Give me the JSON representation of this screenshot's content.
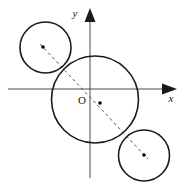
{
  "figure": {
    "width": 181,
    "height": 184,
    "background": "#ffffff",
    "stroke_color": "#1a1a1a",
    "dash_color": "#555555",
    "dot_color": "#000000"
  },
  "axes": {
    "origin": {
      "x": 90,
      "y": 89
    },
    "origin_label": "O",
    "x_axis": {
      "label": "x",
      "label_x": 171,
      "label_y": 102,
      "start_x": 8,
      "end_x": 176,
      "y": 89,
      "arrow": "right"
    },
    "y_axis": {
      "label": "y",
      "label_x": 75,
      "label_y": 17,
      "x": 90,
      "start_y": 178,
      "end_y": 9,
      "arrow": "up"
    }
  },
  "circles": [
    {
      "name": "upper-left-circle",
      "cx": 45.5,
      "cy": 47.5,
      "r": 25.5,
      "center_dot": {
        "x": 43,
        "y": 47
      }
    },
    {
      "name": "central-circle",
      "cx": 95,
      "cy": 99.5,
      "r": 43.5,
      "center_dot": {
        "x": 100,
        "y": 103
      }
    },
    {
      "name": "lower-right-circle",
      "cx": 144,
      "cy": 155.5,
      "r": 25.5,
      "center_dot": {
        "x": 144,
        "y": 155
      }
    }
  ],
  "dashed_line": {
    "name": "centers-collinear-line",
    "x1": 40,
    "y1": 44,
    "x2": 148,
    "y2": 159,
    "dash_pattern": "3,3"
  }
}
